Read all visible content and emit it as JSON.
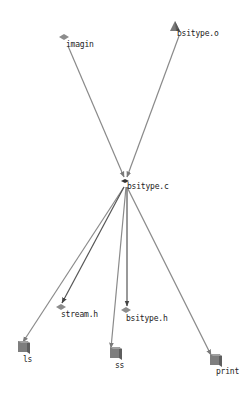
{
  "diagram": {
    "type": "dependency-graph",
    "colors": {
      "edge": "#8a8a8a",
      "edge_dark": "#555555",
      "node_fill": "#8c8c8c",
      "node_dark": "#666666",
      "label": "#222222",
      "background": "#ffffff"
    },
    "nodes": [
      {
        "id": "imagin",
        "label": "imagin",
        "shape": "diamond",
        "x": 64,
        "y": 37,
        "lx": 66,
        "ly": 40
      },
      {
        "id": "bsitype_o",
        "label": "bsitype.o",
        "shape": "triangle",
        "x": 175,
        "y": 27,
        "lx": 177,
        "ly": 29
      },
      {
        "id": "bsitype_c",
        "label": "bsitype.c",
        "shape": "small-diamond",
        "x": 125,
        "y": 181,
        "lx": 127,
        "ly": 182
      },
      {
        "id": "stream_h",
        "label": "stream.h",
        "shape": "diamond",
        "x": 61,
        "y": 307,
        "lx": 61,
        "ly": 310
      },
      {
        "id": "bsitype_h",
        "label": "bsitype.h",
        "shape": "diamond",
        "x": 126,
        "y": 310,
        "lx": 126,
        "ly": 314
      },
      {
        "id": "ls",
        "label": "ls",
        "shape": "box",
        "x": 23,
        "y": 347,
        "lx": 23,
        "ly": 355
      },
      {
        "id": "ss",
        "label": "ss",
        "shape": "box",
        "x": 115,
        "y": 353,
        "lx": 115,
        "ly": 361
      },
      {
        "id": "print",
        "label": "print",
        "shape": "box",
        "x": 215,
        "y": 360,
        "lx": 216,
        "ly": 367
      }
    ],
    "edges": [
      {
        "from": "imagin",
        "to": "bsitype_c",
        "x1": 68,
        "y1": 46,
        "x2": 124,
        "y2": 177,
        "color": "#8a8a8a"
      },
      {
        "from": "bsitype_o",
        "to": "bsitype_c",
        "x1": 179,
        "y1": 36,
        "x2": 127,
        "y2": 177,
        "color": "#8a8a8a"
      },
      {
        "from": "bsitype_c",
        "to": "ls",
        "x1": 124,
        "y1": 187,
        "x2": 23,
        "y2": 342,
        "color": "#8a8a8a"
      },
      {
        "from": "bsitype_c",
        "to": "stream_h",
        "x1": 124,
        "y1": 187,
        "x2": 62,
        "y2": 303,
        "color": "#555555"
      },
      {
        "from": "bsitype_c",
        "to": "ss",
        "x1": 126,
        "y1": 187,
        "x2": 111,
        "y2": 348,
        "color": "#8a8a8a"
      },
      {
        "from": "bsitype_c",
        "to": "bsitype_h",
        "x1": 127,
        "y1": 187,
        "x2": 127,
        "y2": 306,
        "color": "#555555"
      },
      {
        "from": "bsitype_c",
        "to": "print",
        "x1": 127,
        "y1": 187,
        "x2": 211,
        "y2": 355,
        "color": "#8a8a8a"
      }
    ]
  }
}
